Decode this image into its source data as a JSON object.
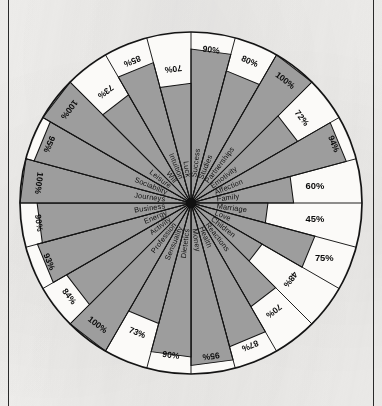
{
  "document": {
    "kind": "scanned-diagram",
    "colors": {
      "paper": "#f4f3f1",
      "ink": "#141414",
      "fill_gray": "#9d9d9d",
      "empty": "#fbfaf8"
    }
  },
  "chart_data": {
    "type": "radar",
    "title": "",
    "subtitle": "",
    "xlabel": "",
    "ylabel": "",
    "ylim": [
      0,
      100
    ],
    "grid": false,
    "legend": null,
    "unit": "%",
    "sector_count": 24,
    "start_angle_deg": -90,
    "direction": "clockwise",
    "categories": [
      "Success",
      "Studies",
      "Partnerships",
      "Emotivity",
      "Affection",
      "Family",
      "Marriage",
      "Love",
      "Children",
      "Reactions",
      "Health",
      "Money",
      "Dietetics",
      "Sensuality",
      "Profession",
      "Activity",
      "Energy",
      "Business",
      "Journeys",
      "Sociability",
      "Leisure",
      "Will",
      "Intuition",
      "Luck"
    ],
    "values": [
      90,
      80,
      100,
      72,
      94,
      60,
      45,
      75,
      48,
      70,
      87,
      95,
      90,
      73,
      100,
      84,
      93,
      90,
      100,
      95,
      100,
      73,
      85,
      70
    ],
    "value_labels": [
      "90%",
      "80%",
      "100%",
      "72%",
      "94%",
      "60%",
      "45%",
      "75%",
      "48%",
      "70%",
      "87%",
      "95%",
      "90%",
      "73%",
      "100%",
      "84%",
      "93%",
      "90%",
      "100%",
      "95%",
      "100%",
      "73%",
      "85%",
      "70%"
    ],
    "horizontal_label_indices": [
      5,
      6,
      7
    ]
  }
}
